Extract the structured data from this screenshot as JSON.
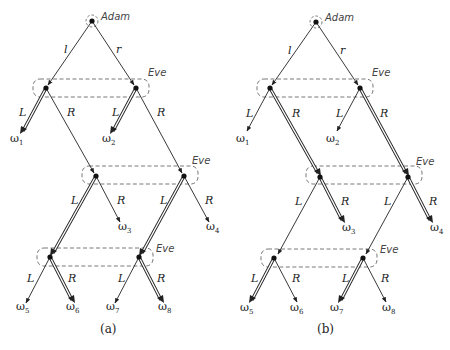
{
  "diagram": {
    "type": "extensive-form game trees",
    "panels": [
      {
        "caption": "(a)",
        "offset_x": 0,
        "root": {
          "x": 92,
          "y": 21,
          "player": "Adam"
        },
        "nodes": {
          "n1L": {
            "x": 46,
            "y": 88
          },
          "n1R": {
            "x": 136,
            "y": 88
          },
          "n2L": {
            "x": 96,
            "y": 176
          },
          "n2R": {
            "x": 184,
            "y": 176
          },
          "n3L": {
            "x": 50,
            "y": 257
          },
          "n3R": {
            "x": 139,
            "y": 257
          }
        },
        "info_sets": [
          {
            "player": "Eve",
            "x": 33,
            "y": 79,
            "w": 116,
            "h": 18
          },
          {
            "player": "Eve",
            "x": 83,
            "y": 166,
            "w": 116,
            "h": 18
          },
          {
            "player": "Eve",
            "x": 37,
            "y": 248,
            "w": 116,
            "h": 18
          }
        ],
        "edges": [
          {
            "from": "root",
            "to": "n1L",
            "label": "l",
            "double": false
          },
          {
            "from": "root",
            "to": "n1R",
            "label": "r",
            "double": false
          },
          {
            "from": "n1L",
            "to": "w1",
            "label": "L",
            "double": true
          },
          {
            "from": "n1L",
            "to": "n2L",
            "label": "R",
            "double": false
          },
          {
            "from": "n1R",
            "to": "w2",
            "label": "L",
            "double": true
          },
          {
            "from": "n1R",
            "to": "n2R",
            "label": "R",
            "double": false
          },
          {
            "from": "n2L",
            "to": "n3L",
            "label": "L",
            "double": true
          },
          {
            "from": "n2L",
            "to": "w3",
            "label": "R",
            "double": false
          },
          {
            "from": "n2R",
            "to": "n3R",
            "label": "L",
            "double": true
          },
          {
            "from": "n2R",
            "to": "w4",
            "label": "R",
            "double": false
          },
          {
            "from": "n3L",
            "to": "w5",
            "label": "L",
            "double": false
          },
          {
            "from": "n3L",
            "to": "w6",
            "label": "R",
            "double": true
          },
          {
            "from": "n3R",
            "to": "w7",
            "label": "L",
            "double": false
          },
          {
            "from": "n3R",
            "to": "w8",
            "label": "R",
            "double": true
          }
        ]
      },
      {
        "caption": "(b)",
        "offset_x": 232,
        "root": {
          "x": 92,
          "y": 21,
          "player": "Adam"
        },
        "info_sets": [
          {
            "player": "Eve"
          },
          {
            "player": "Eve"
          },
          {
            "player": "Eve"
          }
        ],
        "edges": [
          {
            "from": "root",
            "to": "n1L",
            "label": "l",
            "double": false
          },
          {
            "from": "root",
            "to": "n1R",
            "label": "r",
            "double": false
          },
          {
            "from": "n1L",
            "to": "w1",
            "label": "L",
            "double": false
          },
          {
            "from": "n1L",
            "to": "n2L",
            "label": "R",
            "double": true
          },
          {
            "from": "n1R",
            "to": "w2",
            "label": "L",
            "double": false
          },
          {
            "from": "n1R",
            "to": "n2R",
            "label": "R",
            "double": true
          },
          {
            "from": "n2L",
            "to": "n3L",
            "label": "L",
            "double": false
          },
          {
            "from": "n2L",
            "to": "w3",
            "label": "R",
            "double": true
          },
          {
            "from": "n2R",
            "to": "n3R",
            "label": "L",
            "double": false
          },
          {
            "from": "n2R",
            "to": "w4",
            "label": "R",
            "double": true
          },
          {
            "from": "n3L",
            "to": "w5",
            "label": "L",
            "double": true
          },
          {
            "from": "n3L",
            "to": "w6",
            "label": "R",
            "double": false
          },
          {
            "from": "n3R",
            "to": "w7",
            "label": "L",
            "double": true
          },
          {
            "from": "n3R",
            "to": "w8",
            "label": "R",
            "double": false
          }
        ]
      }
    ],
    "labels": {
      "adam": "Adam",
      "eve": "Eve",
      "l": "l",
      "r": "r",
      "L": "L",
      "R": "R",
      "omega": "ω",
      "outcomes": [
        "1",
        "2",
        "3",
        "4",
        "5",
        "6",
        "7",
        "8"
      ],
      "caption_a": "(a)",
      "caption_b": "(b)"
    }
  }
}
